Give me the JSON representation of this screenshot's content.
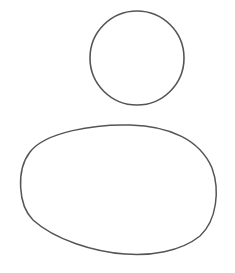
{
  "figure": {
    "stroke_color": "#555555",
    "background_color": "#ffffff",
    "shapes": [
      {
        "name": "head",
        "type": "circle",
        "cx": 137,
        "cy": 58,
        "r": 47
      },
      {
        "name": "body",
        "type": "oval",
        "bbox": [
          20,
          124,
          217,
          254
        ]
      }
    ]
  }
}
